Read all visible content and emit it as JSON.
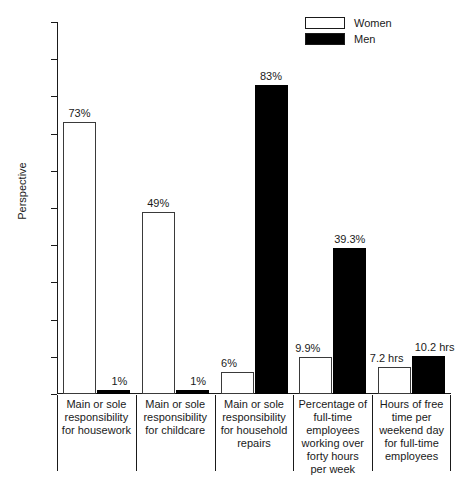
{
  "chart_data": {
    "type": "bar",
    "title": "",
    "xlabel": "",
    "ylabel": "Perspective",
    "ylim": [
      0,
      100
    ],
    "yticks": [
      0,
      10,
      20,
      30,
      40,
      50,
      60,
      70,
      80,
      90,
      100
    ],
    "grid": false,
    "legend_position": "top-right",
    "categories": [
      "Main or sole responsibility for housework",
      "Main or sole responsibility for childcare",
      "Main or sole responsibility for household repairs",
      "Percentage of full-time employees working over forty hours per week",
      "Hours of free time per weekend day for full-time employees"
    ],
    "category_lines": [
      [
        "Main or sole",
        "responsibility",
        "for housework"
      ],
      [
        "Main or sole",
        "responsibility",
        "for childcare"
      ],
      [
        "Main or sole",
        "responsibility",
        "for household",
        "repairs"
      ],
      [
        "Percentage of",
        "full-time",
        "employees",
        "working over",
        "forty hours",
        "per week"
      ],
      [
        "Hours of free",
        "time per",
        "weekend day",
        "for full-time",
        "employees"
      ]
    ],
    "series": [
      {
        "name": "Women",
        "color": "#ffffff",
        "values": [
          73,
          49,
          6,
          9.9,
          7.2
        ],
        "labels": [
          "73%",
          "49%",
          "6%",
          "9.9%",
          "7.2 hrs"
        ]
      },
      {
        "name": "Men",
        "color": "#000000",
        "values": [
          1,
          1,
          83,
          39.3,
          10.2
        ],
        "labels": [
          "1%",
          "1%",
          "83%",
          "39.3%",
          "10.2 hrs"
        ]
      }
    ]
  },
  "legend": {
    "items": [
      {
        "label": "Women",
        "swatch": "empty"
      },
      {
        "label": "Men",
        "swatch": "filled"
      }
    ]
  },
  "axis": {
    "y_title": "Perspective",
    "y_tick_labels": [
      "100",
      "90",
      "80",
      "70",
      "60",
      "50",
      "40",
      "30",
      "20",
      "10",
      "0"
    ]
  }
}
